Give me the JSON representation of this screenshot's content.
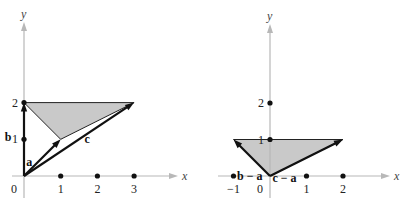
{
  "panels": [
    {
      "id": "left",
      "x_axis_label": "x",
      "y_axis_label": "y",
      "x_range": [
        0,
        3.9
      ],
      "y_range": [
        0,
        3.9
      ],
      "x_ticks": [
        {
          "value": 0,
          "label": "0"
        },
        {
          "value": 1,
          "label": "1"
        },
        {
          "value": 2,
          "label": "2"
        },
        {
          "value": 3,
          "label": "3"
        }
      ],
      "y_ticks": [
        {
          "value": 1,
          "label": "1"
        },
        {
          "value": 2,
          "label": "2"
        }
      ],
      "triangle": [
        [
          0,
          2
        ],
        [
          1,
          1
        ],
        [
          3,
          2
        ]
      ],
      "vectors": [
        {
          "name": "a",
          "label": "a",
          "from": [
            0,
            0
          ],
          "to": [
            1,
            1
          ]
        },
        {
          "name": "b",
          "label": "b",
          "from": [
            0,
            0
          ],
          "to": [
            0,
            2
          ]
        },
        {
          "name": "c",
          "label": "c",
          "from": [
            0,
            0
          ],
          "to": [
            3,
            2
          ]
        }
      ]
    },
    {
      "id": "right",
      "x_axis_label": "x",
      "y_axis_label": "y",
      "x_range": [
        -1.5,
        3.3
      ],
      "y_range": [
        0,
        3.9
      ],
      "x_ticks": [
        {
          "value": -1,
          "label": "−1"
        },
        {
          "value": 0,
          "label": "0"
        },
        {
          "value": 1,
          "label": "1"
        },
        {
          "value": 2,
          "label": "2"
        }
      ],
      "y_ticks": [
        {
          "value": 1,
          "label": "1"
        },
        {
          "value": 2,
          "label": "2"
        }
      ],
      "triangle": [
        [
          0,
          0
        ],
        [
          -1,
          1
        ],
        [
          2,
          1
        ]
      ],
      "vectors": [
        {
          "name": "b-minus-a",
          "label": "b − a",
          "from": [
            0,
            0
          ],
          "to": [
            -1,
            1
          ]
        },
        {
          "name": "c-minus-a",
          "label": "c − a",
          "from": [
            0,
            0
          ],
          "to": [
            2,
            1
          ]
        }
      ]
    }
  ]
}
